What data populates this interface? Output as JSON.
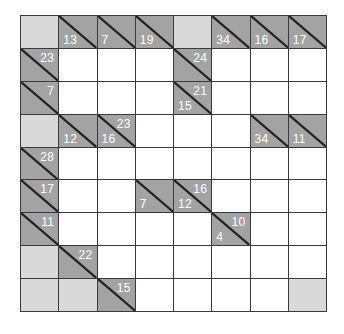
{
  "puzzle": {
    "type": "kakuro",
    "rows": 9,
    "cols": 8,
    "colors": {
      "clue": "#a3a3a3",
      "blank": "#d9d9d9",
      "white": "#ffffff",
      "grid_line": "#3a3a3a",
      "clue_text": "#ffffff"
    },
    "grid": [
      [
        {
          "t": "blank"
        },
        {
          "t": "clue",
          "down": "13"
        },
        {
          "t": "clue",
          "down": "7"
        },
        {
          "t": "clue",
          "down": "19"
        },
        {
          "t": "blank"
        },
        {
          "t": "clue",
          "down": "34"
        },
        {
          "t": "clue",
          "down": "16"
        },
        {
          "t": "clue",
          "down": "17"
        }
      ],
      [
        {
          "t": "clue",
          "right": "23"
        },
        {
          "t": "white"
        },
        {
          "t": "white"
        },
        {
          "t": "white"
        },
        {
          "t": "clue",
          "right": "24"
        },
        {
          "t": "white"
        },
        {
          "t": "white"
        },
        {
          "t": "white"
        }
      ],
      [
        {
          "t": "clue",
          "right": "7"
        },
        {
          "t": "white"
        },
        {
          "t": "white"
        },
        {
          "t": "white"
        },
        {
          "t": "clue",
          "down": "15",
          "right": "21"
        },
        {
          "t": "white"
        },
        {
          "t": "white"
        },
        {
          "t": "white"
        }
      ],
      [
        {
          "t": "blank"
        },
        {
          "t": "clue",
          "down": "12"
        },
        {
          "t": "clue",
          "down": "16",
          "right": "23"
        },
        {
          "t": "white"
        },
        {
          "t": "white"
        },
        {
          "t": "white"
        },
        {
          "t": "clue",
          "down": "34"
        },
        {
          "t": "clue",
          "down": "11"
        }
      ],
      [
        {
          "t": "clue",
          "right": "28"
        },
        {
          "t": "white"
        },
        {
          "t": "white"
        },
        {
          "t": "white"
        },
        {
          "t": "white"
        },
        {
          "t": "white"
        },
        {
          "t": "white"
        },
        {
          "t": "white"
        }
      ],
      [
        {
          "t": "clue",
          "right": "17"
        },
        {
          "t": "white"
        },
        {
          "t": "white"
        },
        {
          "t": "clue",
          "down": "7"
        },
        {
          "t": "clue",
          "down": "12",
          "right": "16"
        },
        {
          "t": "white"
        },
        {
          "t": "white"
        },
        {
          "t": "white"
        }
      ],
      [
        {
          "t": "clue",
          "right": "11"
        },
        {
          "t": "white"
        },
        {
          "t": "white"
        },
        {
          "t": "white"
        },
        {
          "t": "white"
        },
        {
          "t": "clue",
          "down": "4",
          "right": "10"
        },
        {
          "t": "white"
        },
        {
          "t": "white"
        }
      ],
      [
        {
          "t": "blank"
        },
        {
          "t": "clue",
          "right": "22"
        },
        {
          "t": "white"
        },
        {
          "t": "white"
        },
        {
          "t": "white"
        },
        {
          "t": "white"
        },
        {
          "t": "white"
        },
        {
          "t": "white"
        }
      ],
      [
        {
          "t": "blank"
        },
        {
          "t": "blank"
        },
        {
          "t": "clue",
          "right": "15"
        },
        {
          "t": "white"
        },
        {
          "t": "white"
        },
        {
          "t": "white"
        },
        {
          "t": "white"
        },
        {
          "t": "blank"
        }
      ]
    ]
  }
}
